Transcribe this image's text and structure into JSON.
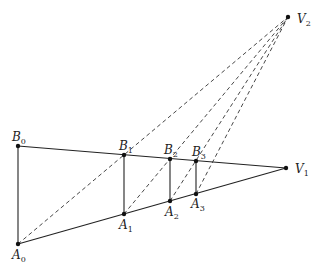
{
  "diagram": {
    "title": "",
    "points": [
      {
        "id": "A0",
        "name": "A",
        "sub": "0"
      },
      {
        "id": "B0",
        "name": "B",
        "sub": "0"
      },
      {
        "id": "A1",
        "name": "A",
        "sub": "1"
      },
      {
        "id": "B1",
        "name": "B",
        "sub": "1"
      },
      {
        "id": "A2",
        "name": "A",
        "sub": "2"
      },
      {
        "id": "B2",
        "name": "B",
        "sub": "2"
      },
      {
        "id": "A3",
        "name": "A",
        "sub": "3"
      },
      {
        "id": "B3",
        "name": "B",
        "sub": "3"
      },
      {
        "id": "V1",
        "name": "V",
        "sub": "1"
      },
      {
        "id": "V2",
        "name": "V",
        "sub": "2"
      }
    ],
    "solid_segments": [
      [
        "B0",
        "V1"
      ],
      [
        "A0",
        "V1"
      ],
      [
        "A0",
        "B0"
      ],
      [
        "A1",
        "B1"
      ],
      [
        "A2",
        "B2"
      ],
      [
        "A3",
        "B3"
      ]
    ],
    "dashed_segments": [
      [
        "A0",
        "V2"
      ],
      [
        "A1",
        "V2"
      ],
      [
        "A2",
        "V2"
      ],
      [
        "A3",
        "V2"
      ]
    ]
  }
}
